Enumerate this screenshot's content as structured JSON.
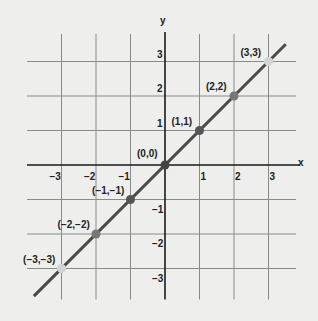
{
  "chart_data": {
    "type": "line",
    "title": "",
    "xlabel": "x",
    "ylabel": "y",
    "xlim": [
      -3.8,
      3.8
    ],
    "ylim": [
      -3.9,
      3.9
    ],
    "grid": true,
    "x_ticks": [
      -3,
      -2,
      -1,
      1,
      2,
      3
    ],
    "y_ticks": [
      3,
      2,
      1,
      -1,
      -2,
      -3
    ],
    "series": [
      {
        "name": "y = x",
        "x": [
          -3.8,
          3.5
        ],
        "y": [
          -3.8,
          3.5
        ]
      }
    ],
    "points": [
      {
        "x": -3,
        "y": -3,
        "label": "(−3,−3)",
        "color": "#d4d4d4"
      },
      {
        "x": -2,
        "y": -2,
        "label": "(−2,−2)",
        "color": "#777777"
      },
      {
        "x": -1,
        "y": -1,
        "label": "(−1,−1)",
        "color": "#555555"
      },
      {
        "x": 0,
        "y": 0,
        "label": "(0,0)",
        "color": "#444444"
      },
      {
        "x": 1,
        "y": 1,
        "label": "(1,1)",
        "color": "#555555"
      },
      {
        "x": 2,
        "y": 2,
        "label": "(2,2)",
        "color": "#777777"
      },
      {
        "x": 3,
        "y": 3,
        "label": "(3,3)",
        "color": "#d4d4d4"
      }
    ],
    "colors": {
      "line": "#4a4a4a",
      "grid": "#8a8a8a",
      "axis": "#1a1a1a",
      "background": "#eeeeec"
    }
  }
}
